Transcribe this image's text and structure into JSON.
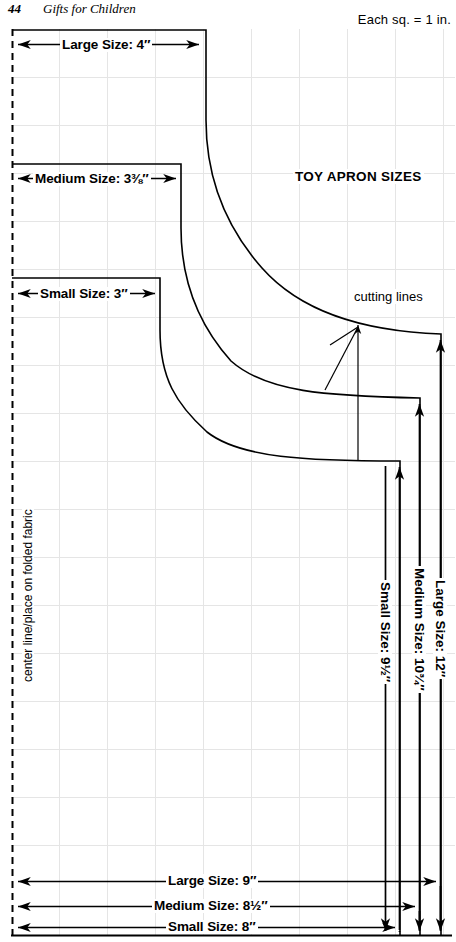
{
  "page": {
    "folio": "44",
    "running_head": "Gifts for Children",
    "grid_note": "Each sq.  =  1 in."
  },
  "diagram": {
    "title": "TOY APRON SIZES",
    "cutting_lines_label": "cutting lines",
    "center_line_label": "center line/place on folded fabric",
    "width_dimensions": [
      {
        "name": "large-top-width",
        "label": "Large Size: 4″"
      },
      {
        "name": "medium-top-width",
        "label": "Medium Size: 3⅜″"
      },
      {
        "name": "small-top-width",
        "label": "Small Size: 3″"
      }
    ],
    "height_dimensions": [
      {
        "name": "large-height",
        "label": "Large Size: 12″"
      },
      {
        "name": "medium-height",
        "label": "Medium Size: 10¾″"
      },
      {
        "name": "small-height",
        "label": "Small Size: 9½″"
      }
    ],
    "bottom_dimensions": [
      {
        "name": "large-bottom-width",
        "label": "Large Size: 9″"
      },
      {
        "name": "medium-bottom-width",
        "label": "Medium Size: 8½″"
      },
      {
        "name": "small-bottom-width",
        "label": "Small Size: 8″"
      }
    ],
    "colors": {
      "ink": "#000000",
      "grid": "#e3e3e3",
      "paper": "#ffffff"
    },
    "grid": {
      "square_inches": 1,
      "spacing_px": 48
    }
  }
}
